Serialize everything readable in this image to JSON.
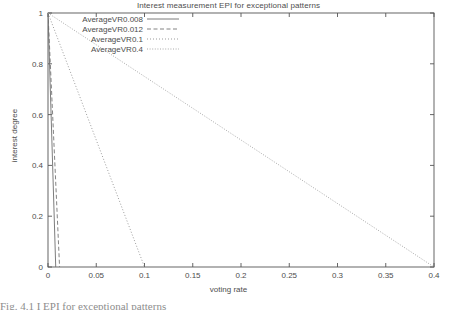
{
  "chart_data": {
    "type": "line",
    "title": "Interest measurement EPI for exceptional patterns",
    "xlabel": "voting rate",
    "ylabel": "interest degree",
    "xlim": [
      0,
      0.4
    ],
    "ylim": [
      0,
      1
    ],
    "xticks": [
      "0",
      "0.05",
      "0.1",
      "0.15",
      "0.2",
      "0.25",
      "0.3",
      "0.35",
      "0.4"
    ],
    "xtick_values": [
      0,
      0.05,
      0.1,
      0.15,
      0.2,
      0.25,
      0.3,
      0.35,
      0.4
    ],
    "yticks": [
      "0",
      "0.2",
      "0.4",
      "0.6",
      "0.8",
      "1"
    ],
    "ytick_values": [
      0,
      0.2,
      0.4,
      0.6,
      0.8,
      1
    ],
    "grid": false,
    "legend_position": "top-left inside",
    "series": [
      {
        "name": "AverageVR0.008",
        "style": "solid",
        "color": "#6e6e6e",
        "x": [
          0,
          0.008
        ],
        "y": [
          1,
          0
        ]
      },
      {
        "name": "AverageVR0.012",
        "style": "dashed",
        "color": "#6e6e6e",
        "x": [
          0,
          0.012
        ],
        "y": [
          1,
          0
        ]
      },
      {
        "name": "AverageVR0.1",
        "style": "dotted",
        "color": "#8a8a8a",
        "x": [
          0,
          0.1
        ],
        "y": [
          1,
          0
        ]
      },
      {
        "name": "AverageVR0.4",
        "style": "fine-dotted",
        "color": "#9a9a9a",
        "x": [
          0,
          0.4
        ],
        "y": [
          1,
          0
        ]
      }
    ]
  },
  "caption": {
    "text": "Fig. 4.1  I                                       EPI for exceptional patterns"
  }
}
